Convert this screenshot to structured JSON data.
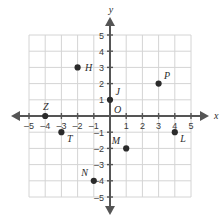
{
  "chart_data": {
    "type": "scatter",
    "title": "",
    "xlabel": "x",
    "ylabel": "y",
    "xlim": [
      -5,
      5
    ],
    "ylim": [
      -5,
      5
    ],
    "grid": true,
    "legend": "none",
    "x_ticks": [
      "-5",
      "-4",
      "-3",
      "-2",
      "-1",
      "1",
      "2",
      "3",
      "4",
      "5"
    ],
    "y_ticks": [
      "5",
      "4",
      "3",
      "2",
      "1",
      "-1",
      "-2",
      "-3",
      "-4",
      "-5"
    ],
    "origin_label": "O",
    "points": [
      {
        "label": "H",
        "x": -2,
        "y": 3,
        "label_pos": "right"
      },
      {
        "label": "Z",
        "x": -4,
        "y": 0,
        "label_pos": "above"
      },
      {
        "label": "T",
        "x": -3,
        "y": -1,
        "label_pos": "below-right"
      },
      {
        "label": "J",
        "x": 0,
        "y": 1,
        "label_pos": "above-right"
      },
      {
        "label": "P",
        "x": 3,
        "y": 2,
        "label_pos": "above-right"
      },
      {
        "label": "L",
        "x": 4,
        "y": -1,
        "label_pos": "below-right"
      },
      {
        "label": "M",
        "x": 1,
        "y": -2,
        "label_pos": "above-left"
      },
      {
        "label": "N",
        "x": -1,
        "y": -4,
        "label_pos": "above-left"
      }
    ],
    "colors": {
      "grid": "#d4d4d4",
      "axis": "#555555",
      "point": "#2b2b2b",
      "text": "#2b2b2b",
      "background": "#ffffff"
    }
  },
  "axes": {
    "x_axis_label": "x",
    "y_axis_label": "y",
    "origin_label": "O"
  }
}
